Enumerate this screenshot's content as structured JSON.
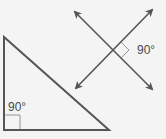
{
  "diagram": {
    "background": "#f4f4f4",
    "line_color": "#555555",
    "marker_color": "#8a8a8a",
    "perpendicular_lines": {
      "angle_label": "90°",
      "intersection": [
        113,
        50
      ],
      "line_a": {
        "from": [
          75,
          12
        ],
        "to": [
          152,
          89
        ]
      },
      "line_b": {
        "from": [
          76,
          88
        ],
        "to": [
          152,
          10
        ]
      }
    },
    "right_triangle": {
      "angle_label": "90°",
      "vertices": [
        [
          4,
          37
        ],
        [
          4,
          130
        ],
        [
          109,
          130
        ]
      ]
    }
  }
}
